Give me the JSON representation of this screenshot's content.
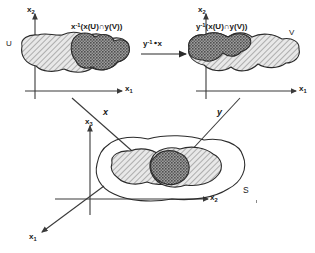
{
  "colors": {
    "ink": "#1a1a1a",
    "outline": "#2b2b2b",
    "hatch_light": "#b9b9b9",
    "hatch_light_bg": "#e8e8e8",
    "stipple_dark": "#585858",
    "stipple_dark_bg": "#9a9a9a",
    "axis": "#3a3a3a",
    "paper": "#ffffff"
  },
  "left_panel": {
    "name": "x-parameter-domain",
    "axis_vertical": {
      "base": "x",
      "sub": "2"
    },
    "axis_horizontal": {
      "base": "x",
      "sub": "1"
    },
    "set_label": "U",
    "region_expression": {
      "base": "x",
      "sup": "-1",
      "arg": "(x(U)∩y(V))",
      "full": "x⁻¹(x(U)∩y(V))"
    }
  },
  "right_panel": {
    "name": "y-parameter-domain",
    "axis_vertical": {
      "base": "x",
      "sub": "2"
    },
    "axis_horizontal": {
      "base": "x",
      "sub": "1"
    },
    "set_label": "V",
    "region_expression": {
      "base": "y",
      "sup": "-1",
      "arg": "(x(U)∩y(V))",
      "full": "y⁻¹(x(U)∩y(V))"
    }
  },
  "transition": {
    "name": "transition-map",
    "label": {
      "base": "y",
      "sup": "-1",
      "rest": "∘x",
      "full": "y⁻¹∘x"
    },
    "direction": "left-to-right"
  },
  "maps": {
    "left_chart_label": "x",
    "right_chart_label": "y"
  },
  "manifold_panel": {
    "name": "manifold-surface",
    "surface_label": "S",
    "axis_vertical": {
      "base": "x",
      "sub": "3"
    },
    "axis_horizontal": {
      "base": "x",
      "sub": "2"
    },
    "axis_depth": {
      "base": "x",
      "sub": "1"
    }
  }
}
